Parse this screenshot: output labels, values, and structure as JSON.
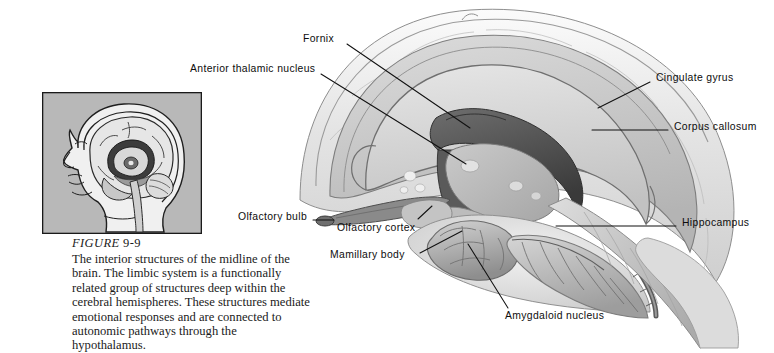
{
  "figure": {
    "number_word": "FIGURE",
    "number_id": "9-9",
    "caption": "The interior structures of the midline of the brain. The limbic system is a functionally related group of structures deep within the cerebral hemispheres. These structures mediate emotional responses and are connected to autonomic pathways through the hypothalamus."
  },
  "inset": {
    "name": "head-midsagittal-orientation-inset",
    "background": "#b8b8b8",
    "border": "#1a1a1a"
  },
  "labels": [
    {
      "id": "fornix",
      "text": "Fornix",
      "side": "left"
    },
    {
      "id": "anterior-thalamic-nucleus",
      "text": "Anterior thalamic nucleus",
      "side": "left"
    },
    {
      "id": "cingulate-gyrus",
      "text": "Cingulate gyrus",
      "side": "right"
    },
    {
      "id": "corpus-callosum",
      "text": "Corpus callosum",
      "side": "right"
    },
    {
      "id": "hippocampus",
      "text": "Hippocampus",
      "side": "right"
    },
    {
      "id": "olfactory-bulb",
      "text": "Olfactory bulb",
      "side": "left"
    },
    {
      "id": "olfactory-cortex",
      "text": "Olfactory cortex",
      "side": "left"
    },
    {
      "id": "mamillary-body",
      "text": "Mamillary body",
      "side": "left"
    },
    {
      "id": "amygdaloid-nucleus",
      "text": "Amygdaloid nucleus",
      "side": "bottom"
    }
  ],
  "colors": {
    "page_background": "#ffffff",
    "leader_line": "#111111",
    "brain_light": "#e8e8e8",
    "brain_mid": "#c9c9c9",
    "brain_dark": "#8f8f8f",
    "brain_darkest": "#4a4a4a",
    "outline": "#6e6e6e"
  }
}
